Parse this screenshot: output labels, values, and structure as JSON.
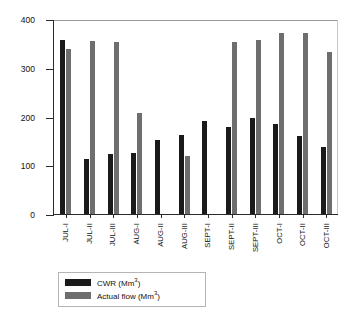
{
  "chart_data": {
    "type": "bar",
    "title": "",
    "xlabel": "",
    "ylabel": "Flow (Mm3)",
    "ylabel_base": "Flow (Mm",
    "ylabel_sup": "3",
    "ylabel_close": ")",
    "ylim": [
      0,
      400
    ],
    "yticks": [
      0,
      100,
      200,
      300,
      400
    ],
    "ytick_labels": [
      "0",
      "100",
      "200",
      "300",
      "400"
    ],
    "grid": false,
    "legend_position": "bottom-left",
    "categories": [
      "JUL-I",
      "JUL-II",
      "JUL-III",
      "AUG-I",
      "AUG-II",
      "AUG-III",
      "SEPT-I",
      "SEPT-II",
      "SEPT-III",
      "OCT-I",
      "OCT-II",
      "OCT-III"
    ],
    "series": [
      {
        "name": "CWR (Mm3)",
        "name_base": "CWR (Mm",
        "name_sup": "3",
        "name_close": ")",
        "color": "#1a1a1a",
        "values": [
          357,
          112,
          124,
          125,
          152,
          163,
          190,
          178,
          196,
          185,
          161,
          138
        ]
      },
      {
        "name": "Actual flow (Mm3)",
        "name_base": "Actual flow (Mm",
        "name_sup": "3",
        "name_close": ")",
        "color": "#6e6e6e",
        "values": [
          338,
          355,
          353,
          208,
          null,
          120,
          null,
          352,
          356,
          372,
          372,
          332
        ]
      }
    ]
  }
}
